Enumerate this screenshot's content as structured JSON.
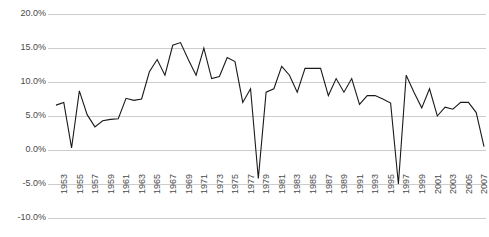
{
  "chart_data": {
    "type": "line",
    "title": "",
    "xlabel": "",
    "ylabel": "",
    "grid": true,
    "legend": null,
    "ylim": [
      -10,
      20
    ],
    "yticks": [
      20,
      15,
      10,
      5,
      0,
      -5,
      -10
    ],
    "ytick_labels": [
      "20.0%",
      "15.0%",
      "10.0%",
      "5.0%",
      "0.0%",
      "-5.0%",
      "-10.0%"
    ],
    "xlim": [
      1953,
      2008
    ],
    "xtick_labels": [
      "1953",
      "1955",
      "1957",
      "1959",
      "1961",
      "1963",
      "1965",
      "1967",
      "1969",
      "1971",
      "1973",
      "1975",
      "1977",
      "1979",
      "1981",
      "1983",
      "1985",
      "1987",
      "1989",
      "1991",
      "1993",
      "1995",
      "1997",
      "1999",
      "2001",
      "2003",
      "2005",
      "2007"
    ],
    "x": [
      1953,
      1954,
      1955,
      1956,
      1957,
      1958,
      1959,
      1960,
      1961,
      1962,
      1963,
      1964,
      1965,
      1966,
      1967,
      1968,
      1969,
      1970,
      1971,
      1972,
      1973,
      1974,
      1975,
      1976,
      1977,
      1978,
      1979,
      1980,
      1981,
      1982,
      1983,
      1984,
      1985,
      1986,
      1987,
      1988,
      1989,
      1990,
      1991,
      1992,
      1993,
      1994,
      1995,
      1996,
      1997,
      1998,
      1999,
      2000,
      2001,
      2002,
      2003,
      2004,
      2005,
      2006,
      2007,
      2008
    ],
    "values": [
      6.6,
      7.0,
      0.3,
      8.7,
      5.2,
      3.4,
      4.3,
      4.5,
      4.6,
      7.6,
      7.3,
      7.5,
      11.5,
      13.3,
      11.0,
      15.4,
      15.8,
      13.3,
      11.0,
      15.0,
      10.5,
      10.8,
      13.6,
      13.0,
      7.0,
      9.0,
      -4.2,
      8.5,
      9.0,
      12.3,
      11.0,
      8.5,
      12.0,
      12.0,
      12.0,
      8.0,
      10.5,
      8.5,
      10.5,
      6.7,
      8.0,
      8.0,
      7.5,
      6.9,
      -5.0,
      11.0,
      8.5,
      6.2,
      9.0,
      5.0,
      6.3,
      6.0,
      7.0,
      7.0,
      5.5,
      0.5
    ],
    "series_color": "#1a1a1a",
    "grid_color": "#cccccc",
    "axis_text_color": "#4a4a4a",
    "background": "#ffffff"
  }
}
